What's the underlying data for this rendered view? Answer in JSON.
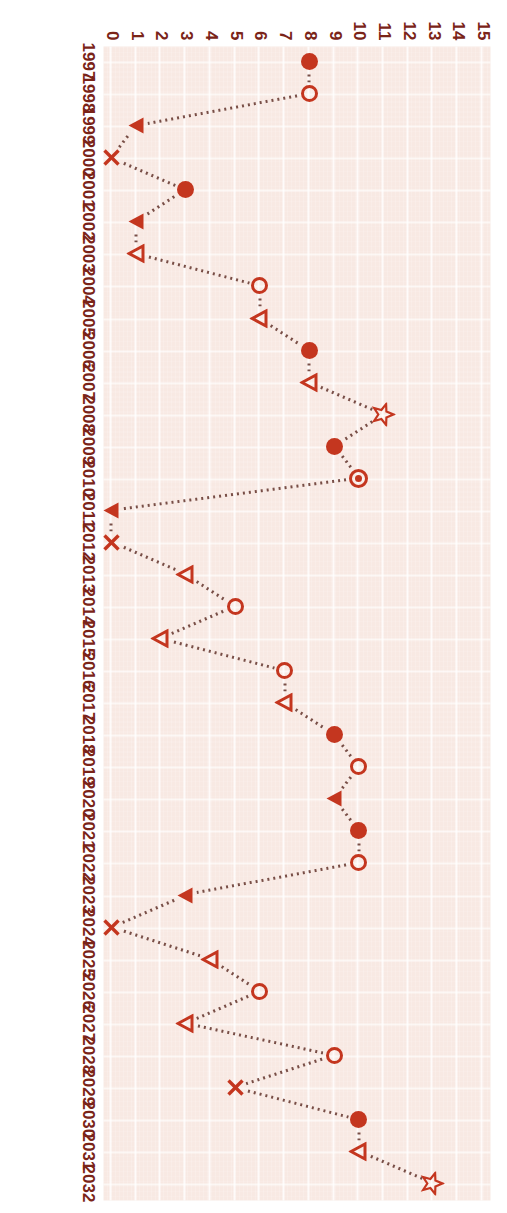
{
  "chart": {
    "type": "scatter",
    "title": "",
    "xlabel": "",
    "ylabel": "",
    "orientation": "rotated-90-clockwise",
    "value_axis": {
      "position": "top",
      "min": 0,
      "max": 15,
      "ticks": [
        "0",
        "1",
        "2",
        "3",
        "4",
        "5",
        "6",
        "7",
        "8",
        "9",
        "10",
        "11",
        "12",
        "13",
        "14",
        "15"
      ]
    },
    "category_axis": {
      "position": "left",
      "label_type": "year"
    },
    "colors": {
      "marker": "#c4361f",
      "connector": "#6d4038",
      "plot_background": "#f8e9e3",
      "grid": "#ffffff",
      "tick_label": "#7a2418",
      "page_background": "#ffffff"
    },
    "marker_legend": [
      {
        "key": "circle-filled",
        "name": "filled-circle-marker"
      },
      {
        "key": "circle-open",
        "name": "open-circle-marker"
      },
      {
        "key": "triangle-filled",
        "name": "filled-left-triangle-marker"
      },
      {
        "key": "triangle-open",
        "name": "open-left-triangle-marker"
      },
      {
        "key": "x",
        "name": "x-cross-marker"
      },
      {
        "key": "star",
        "name": "open-star-marker"
      },
      {
        "key": "target",
        "name": "target-circle-marker"
      }
    ]
  },
  "chart_data": {
    "type": "scatter",
    "title": "",
    "xlabel": "",
    "ylabel": "",
    "xlim": [
      0,
      15
    ],
    "grid": true,
    "legend": "none",
    "categories": [
      "1997",
      "1998",
      "1999",
      "2000",
      "2001",
      "2002",
      "2003",
      "2004",
      "2005",
      "2006",
      "2007",
      "2008",
      "2009",
      "2010",
      "2011",
      "2012",
      "2013",
      "2014",
      "2015",
      "2016",
      "2017",
      "2018",
      "2019",
      "2020",
      "2021",
      "2022",
      "2023",
      "2024",
      "2025",
      "2026",
      "2027",
      "2028",
      "2029",
      "2030",
      "2031",
      "2032"
    ],
    "values": [
      8,
      8,
      1,
      0,
      3,
      1,
      1,
      6,
      6,
      8,
      8,
      11,
      9,
      10,
      0,
      0,
      3,
      5,
      2,
      7,
      7,
      9,
      10,
      9,
      10,
      10,
      3,
      0,
      4,
      6,
      3,
      9,
      5,
      10,
      10,
      13
    ],
    "markers": [
      "circle-filled",
      "circle-open",
      "triangle-filled",
      "x",
      "circle-filled",
      "triangle-filled",
      "triangle-open",
      "circle-open",
      "triangle-open",
      "circle-filled",
      "triangle-open",
      "star",
      "circle-filled",
      "target",
      "triangle-filled",
      "x",
      "triangle-open",
      "circle-open",
      "triangle-open",
      "circle-open",
      "triangle-open",
      "circle-filled",
      "circle-open",
      "triangle-filled",
      "circle-filled",
      "circle-open",
      "triangle-filled",
      "x",
      "triangle-open",
      "circle-open",
      "triangle-open",
      "circle-open",
      "x",
      "circle-filled",
      "triangle-open",
      "star"
    ],
    "points": [
      {
        "category": "1997",
        "value": 8,
        "marker": "circle-filled"
      },
      {
        "category": "1998",
        "value": 8,
        "marker": "circle-open"
      },
      {
        "category": "1999",
        "value": 1,
        "marker": "triangle-filled"
      },
      {
        "category": "2000",
        "value": 0,
        "marker": "x"
      },
      {
        "category": "2001",
        "value": 3,
        "marker": "circle-filled"
      },
      {
        "category": "2002",
        "value": 1,
        "marker": "triangle-filled"
      },
      {
        "category": "2003",
        "value": 1,
        "marker": "triangle-open"
      },
      {
        "category": "2004",
        "value": 6,
        "marker": "circle-open"
      },
      {
        "category": "2005",
        "value": 6,
        "marker": "triangle-open"
      },
      {
        "category": "2006",
        "value": 8,
        "marker": "circle-filled"
      },
      {
        "category": "2007",
        "value": 8,
        "marker": "triangle-open"
      },
      {
        "category": "2008",
        "value": 11,
        "marker": "star"
      },
      {
        "category": "2009",
        "value": 9,
        "marker": "circle-filled"
      },
      {
        "category": "2010",
        "value": 10,
        "marker": "target"
      },
      {
        "category": "2011",
        "value": 0,
        "marker": "triangle-filled"
      },
      {
        "category": "2012",
        "value": 0,
        "marker": "x"
      },
      {
        "category": "2013",
        "value": 3,
        "marker": "triangle-open"
      },
      {
        "category": "2014",
        "value": 5,
        "marker": "circle-open"
      },
      {
        "category": "2015",
        "value": 2,
        "marker": "triangle-open"
      },
      {
        "category": "2016",
        "value": 7,
        "marker": "circle-open"
      },
      {
        "category": "2017",
        "value": 7,
        "marker": "triangle-open"
      },
      {
        "category": "2018",
        "value": 9,
        "marker": "circle-filled"
      },
      {
        "category": "2019",
        "value": 10,
        "marker": "circle-open"
      },
      {
        "category": "2020",
        "value": 9,
        "marker": "triangle-filled"
      },
      {
        "category": "2021",
        "value": 10,
        "marker": "circle-filled"
      },
      {
        "category": "2022",
        "value": 10,
        "marker": "circle-open"
      },
      {
        "category": "2023",
        "value": 3,
        "marker": "triangle-filled"
      },
      {
        "category": "2024",
        "value": 0,
        "marker": "x"
      },
      {
        "category": "2025",
        "value": 4,
        "marker": "triangle-open"
      },
      {
        "category": "2026",
        "value": 6,
        "marker": "circle-open"
      },
      {
        "category": "2027",
        "value": 3,
        "marker": "triangle-open"
      },
      {
        "category": "2028",
        "value": 9,
        "marker": "circle-open"
      },
      {
        "category": "2029",
        "value": 5,
        "marker": "x"
      },
      {
        "category": "2030",
        "value": 10,
        "marker": "circle-filled"
      },
      {
        "category": "2031",
        "value": 10,
        "marker": "triangle-open"
      },
      {
        "category": "2032",
        "value": 13,
        "marker": "star"
      }
    ]
  }
}
